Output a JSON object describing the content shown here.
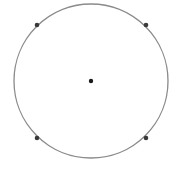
{
  "diagram": {
    "type": "geometry",
    "background": "#ffffff",
    "circle": {
      "cx": 91,
      "cy": 81,
      "r": 77,
      "stroke": "#8a8a8a",
      "stroke_width": 1.3
    },
    "center_point": {
      "x": 91,
      "y": 81,
      "r": 2.2,
      "fill": "#1a1a1a"
    },
    "circumference_points": [
      {
        "id": "top-left",
        "x": 37,
        "y": 25,
        "r": 2.3,
        "fill": "#3a3a3a"
      },
      {
        "id": "top-right",
        "x": 146,
        "y": 25,
        "r": 2.3,
        "fill": "#3a3a3a"
      },
      {
        "id": "bottom-left",
        "x": 37,
        "y": 138,
        "r": 2.3,
        "fill": "#3a3a3a"
      },
      {
        "id": "bottom-right",
        "x": 146,
        "y": 138,
        "r": 2.3,
        "fill": "#3a3a3a"
      }
    ]
  }
}
